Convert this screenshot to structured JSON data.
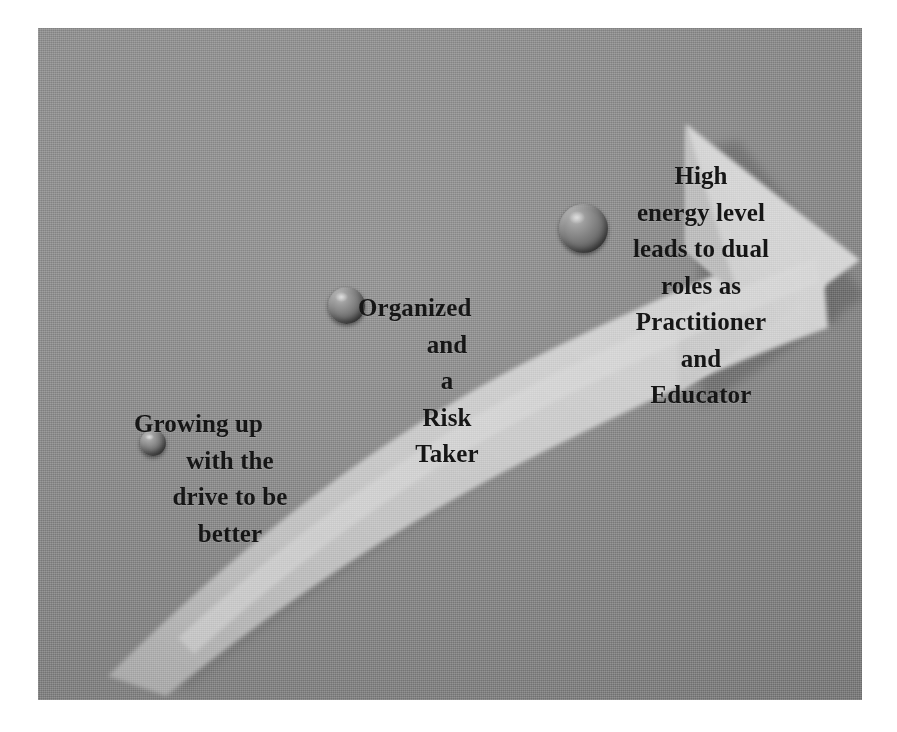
{
  "figure": {
    "kind": "progression-arrow-diagram",
    "background_color": "#8c8c8c",
    "arrow_color": "#cfcfcf",
    "arrow_shadow_color": "#7a7a7a",
    "text_color": "#161616",
    "page_color": "#ffffff"
  },
  "stages": [
    {
      "id": "stage-1",
      "marker": "milestone-sphere-small",
      "lines": [
        "Growing up",
        "with the",
        "drive to be",
        "better"
      ]
    },
    {
      "id": "stage-2",
      "marker": "milestone-sphere-medium",
      "lines": [
        "Organized",
        "and",
        "a",
        "Risk",
        "Taker"
      ]
    },
    {
      "id": "stage-3",
      "marker": "milestone-sphere-large",
      "lines": [
        "High",
        "energy level",
        "leads to dual",
        "roles as",
        "Practitioner",
        "and",
        "Educator"
      ]
    }
  ]
}
